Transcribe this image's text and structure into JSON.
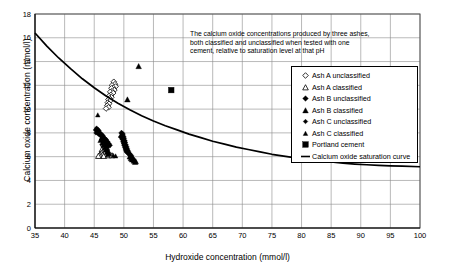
{
  "chart_data": {
    "type": "scatter",
    "title": "",
    "xlabel": "Hydroxide concentration (mmol/l)",
    "ylabel": "Calcium oxide concentration (mmol/l)",
    "xlim": [
      35,
      100
    ],
    "ylim": [
      0,
      18
    ],
    "xticks": [
      35,
      40,
      45,
      50,
      55,
      60,
      65,
      70,
      75,
      80,
      85,
      90,
      95,
      100
    ],
    "yticks": [
      0,
      2,
      4,
      6,
      8,
      10,
      12,
      14,
      16,
      18
    ],
    "grid": true,
    "legend_position": "right-upper",
    "annotation": {
      "line1": "The calcium oxide concentrations produced by three ashes,",
      "line2": "both classified and unclassified when tested with one",
      "line3": "cement, relative to saturation level at that pH"
    },
    "series": [
      {
        "name": "Ash A unclassified",
        "marker": "open-diamond",
        "color": "#000000",
        "points": [
          [
            48.3,
            12.3
          ],
          [
            48.5,
            12.1
          ],
          [
            48.0,
            12.0
          ],
          [
            48.6,
            11.9
          ],
          [
            48.2,
            11.8
          ],
          [
            47.9,
            11.75
          ],
          [
            48.4,
            11.6
          ],
          [
            48.0,
            11.5
          ],
          [
            47.7,
            11.45
          ],
          [
            48.2,
            11.35
          ],
          [
            47.8,
            11.2
          ],
          [
            47.5,
            11.1
          ],
          [
            47.9,
            11.0
          ],
          [
            47.6,
            10.9
          ],
          [
            47.4,
            10.8
          ],
          [
            47.7,
            10.7
          ],
          [
            47.3,
            10.55
          ],
          [
            47.5,
            10.45
          ],
          [
            47.2,
            10.3
          ],
          [
            47.4,
            10.15
          ],
          [
            47.0,
            10.05
          ]
        ]
      },
      {
        "name": "Ash A classified",
        "marker": "open-triangle",
        "color": "#000000",
        "points": [
          [
            46.4,
            7.6
          ],
          [
            46.6,
            7.4
          ],
          [
            46.8,
            7.3
          ],
          [
            47.0,
            7.2
          ],
          [
            46.5,
            7.1
          ],
          [
            46.9,
            7.0
          ],
          [
            47.2,
            6.95
          ],
          [
            46.7,
            6.85
          ],
          [
            47.1,
            6.75
          ],
          [
            46.6,
            6.7
          ],
          [
            46.3,
            6.6
          ],
          [
            46.8,
            6.55
          ],
          [
            47.0,
            6.45
          ],
          [
            46.5,
            6.4
          ],
          [
            46.2,
            6.3
          ],
          [
            46.7,
            6.25
          ],
          [
            46.0,
            6.2
          ],
          [
            46.4,
            6.15
          ],
          [
            45.9,
            6.1
          ],
          [
            46.6,
            6.05
          ],
          [
            47.4,
            6.1
          ],
          [
            48.0,
            6.1
          ],
          [
            45.7,
            6.05
          ]
        ]
      },
      {
        "name": "Ash B unclassified",
        "marker": "filled-diamond",
        "color": "#000000",
        "points": [
          [
            49.6,
            8.0
          ],
          [
            49.8,
            7.9
          ],
          [
            49.7,
            7.8
          ],
          [
            49.9,
            7.7
          ],
          [
            49.5,
            7.65
          ],
          [
            50.0,
            7.55
          ],
          [
            49.8,
            7.45
          ],
          [
            50.1,
            7.35
          ],
          [
            49.9,
            7.25
          ],
          [
            50.2,
            7.2
          ],
          [
            50.0,
            7.1
          ],
          [
            50.3,
            7.0
          ],
          [
            50.1,
            6.95
          ],
          [
            50.4,
            6.85
          ],
          [
            50.2,
            6.8
          ],
          [
            50.5,
            6.7
          ],
          [
            50.3,
            6.65
          ],
          [
            50.6,
            6.55
          ],
          [
            50.4,
            6.5
          ],
          [
            50.7,
            6.45
          ],
          [
            50.5,
            6.4
          ],
          [
            50.8,
            6.3
          ],
          [
            50.9,
            6.25
          ],
          [
            51.0,
            6.15
          ],
          [
            51.2,
            6.1
          ]
        ]
      },
      {
        "name": "Ash B classified",
        "marker": "filled-triangle",
        "color": "#000000",
        "points": [
          [
            51.0,
            6.0
          ],
          [
            51.3,
            5.95
          ],
          [
            51.5,
            5.9
          ],
          [
            51.2,
            5.85
          ],
          [
            51.6,
            5.8
          ],
          [
            51.4,
            5.75
          ],
          [
            51.8,
            5.7
          ],
          [
            51.7,
            5.65
          ],
          [
            52.0,
            5.6
          ],
          [
            51.9,
            5.55
          ],
          [
            52.5,
            13.6
          ],
          [
            50.6,
            10.8
          ]
        ]
      },
      {
        "name": "Ash C unclassified",
        "marker": "filled-diamond-small",
        "color": "#000000",
        "points": [
          [
            45.4,
            8.4
          ],
          [
            45.6,
            8.3
          ],
          [
            45.2,
            8.25
          ],
          [
            45.8,
            8.2
          ],
          [
            45.5,
            8.1
          ],
          [
            45.9,
            8.05
          ],
          [
            45.3,
            8.0
          ],
          [
            46.1,
            7.95
          ],
          [
            45.7,
            7.9
          ],
          [
            46.3,
            7.85
          ],
          [
            46.0,
            7.8
          ],
          [
            46.5,
            7.75
          ],
          [
            46.2,
            7.7
          ],
          [
            46.7,
            7.6
          ],
          [
            46.4,
            7.55
          ],
          [
            46.9,
            7.5
          ],
          [
            46.6,
            7.45
          ],
          [
            47.1,
            7.4
          ],
          [
            46.8,
            7.3
          ],
          [
            47.3,
            7.25
          ],
          [
            47.0,
            7.2
          ],
          [
            47.5,
            7.1
          ],
          [
            47.2,
            7.05
          ],
          [
            47.7,
            6.95
          ],
          [
            47.4,
            6.9
          ]
        ]
      },
      {
        "name": "Ash C classified",
        "marker": "filled-triangle-small",
        "color": "#000000",
        "points": [
          [
            45.6,
            9.5
          ],
          [
            46.2,
            7.55
          ],
          [
            46.4,
            7.45
          ],
          [
            46.0,
            7.35
          ],
          [
            46.6,
            7.25
          ],
          [
            46.3,
            7.15
          ],
          [
            46.8,
            7.05
          ],
          [
            46.5,
            6.95
          ],
          [
            47.0,
            6.85
          ],
          [
            46.7,
            6.75
          ],
          [
            47.2,
            6.65
          ],
          [
            46.9,
            6.55
          ],
          [
            47.4,
            6.45
          ],
          [
            47.1,
            6.35
          ],
          [
            47.6,
            6.25
          ],
          [
            47.3,
            6.15
          ],
          [
            48.2,
            6.1
          ],
          [
            48.6,
            6.05
          ]
        ]
      },
      {
        "name": "Portland cement",
        "marker": "filled-square",
        "color": "#000000",
        "points": [
          [
            58.0,
            11.6
          ]
        ]
      }
    ],
    "curve": {
      "name": "Calcium oxide saturation curve",
      "marker": "line",
      "color": "#000000",
      "points": [
        [
          35,
          16.4
        ],
        [
          37,
          15.3
        ],
        [
          39,
          14.3
        ],
        [
          41,
          13.4
        ],
        [
          43,
          12.55
        ],
        [
          45,
          11.8
        ],
        [
          47,
          11.1
        ],
        [
          49,
          10.5
        ],
        [
          51,
          9.95
        ],
        [
          53,
          9.45
        ],
        [
          55,
          9.0
        ],
        [
          57,
          8.6
        ],
        [
          59,
          8.25
        ],
        [
          61,
          7.9
        ],
        [
          63,
          7.6
        ],
        [
          65,
          7.3
        ],
        [
          67,
          7.05
        ],
        [
          69,
          6.8
        ],
        [
          71,
          6.6
        ],
        [
          73,
          6.4
        ],
        [
          75,
          6.2
        ],
        [
          77,
          6.05
        ],
        [
          79,
          5.9
        ],
        [
          81,
          5.75
        ],
        [
          83,
          5.65
        ],
        [
          85,
          5.55
        ],
        [
          87,
          5.45
        ],
        [
          89,
          5.38
        ],
        [
          91,
          5.32
        ],
        [
          93,
          5.27
        ],
        [
          95,
          5.23
        ],
        [
          97,
          5.2
        ],
        [
          100,
          5.15
        ]
      ]
    },
    "legend_entries": [
      {
        "label": "Ash A unclassified",
        "marker": "open-diamond"
      },
      {
        "label": "Ash A classified",
        "marker": "open-triangle"
      },
      {
        "label": "Ash B unclassified",
        "marker": "filled-diamond"
      },
      {
        "label": "Ash B classified",
        "marker": "filled-triangle"
      },
      {
        "label": "Ash C unclassified",
        "marker": "filled-diamond-small"
      },
      {
        "label": "Ash C classified",
        "marker": "filled-triangle-small"
      },
      {
        "label": "Portland cement",
        "marker": "filled-square"
      },
      {
        "label": "Calcium oxide saturation curve",
        "marker": "line"
      }
    ]
  }
}
